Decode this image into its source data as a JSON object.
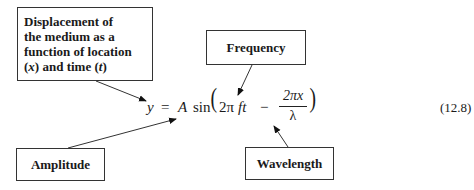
{
  "labels": {
    "displacement": {
      "line1": "Displacement of",
      "line2": "the medium as a",
      "line3": "function of location",
      "line4_open": "(",
      "line4_x": "x",
      "line4_mid": ") and time (",
      "line4_t": "t",
      "line4_close": ")"
    },
    "frequency": "Frequency",
    "amplitude": "Amplitude",
    "wavelength": "Wavelength"
  },
  "equation": {
    "y": "y",
    "equals": "=",
    "A": "A",
    "sin": "sin",
    "lparen": "(",
    "two_pi": "2π",
    "ft": "ft",
    "minus": "−",
    "frac_num": "2πx",
    "frac_den": "λ",
    "rparen": ")",
    "number": "(12.8)"
  }
}
